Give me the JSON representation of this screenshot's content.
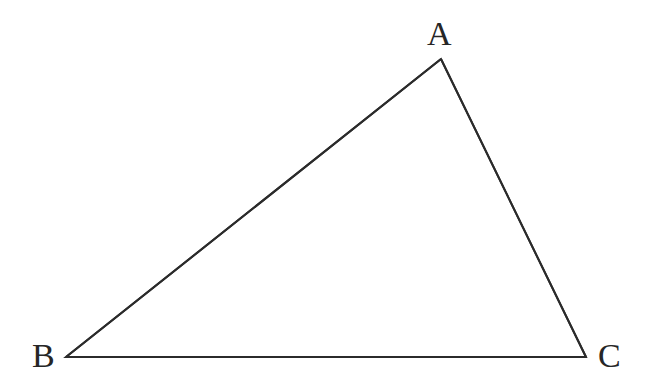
{
  "figure": {
    "kind": "geometry-diagram",
    "name": "triangle-abc",
    "background_color": "#ffffff",
    "stroke_color": "#2b2b2b",
    "stroke_width": 2,
    "label_color": "#262626",
    "label_font_size": 34,
    "canvas": {
      "width": 646,
      "height": 388
    },
    "vertices": [
      {
        "id": "A",
        "label": "A",
        "x": 441,
        "y": 59,
        "label_x": 439,
        "label_y": 34
      },
      {
        "id": "B",
        "label": "B",
        "x": 66,
        "y": 357,
        "label_x": 43,
        "label_y": 356
      },
      {
        "id": "C",
        "label": "C",
        "x": 586,
        "y": 357,
        "label_x": 609,
        "label_y": 356
      }
    ],
    "edges": [
      {
        "id": "AB",
        "from": "A",
        "to": "B"
      },
      {
        "id": "AC",
        "from": "A",
        "to": "C"
      },
      {
        "id": "BC",
        "from": "B",
        "to": "C"
      }
    ],
    "polygon_points": "441,59 66,357 586,357"
  }
}
